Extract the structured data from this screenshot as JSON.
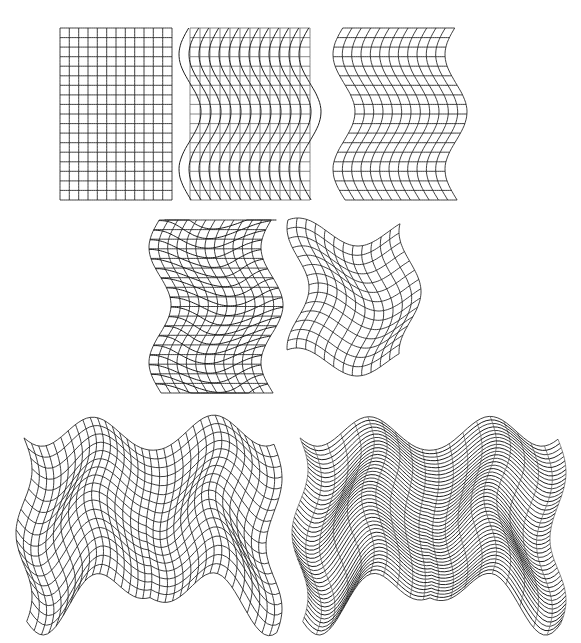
{
  "figure": {
    "width": 581,
    "height": 643,
    "background": "#ffffff",
    "line_color": "#2a2a2a",
    "panels": [
      {
        "id": "regular-grid",
        "description": "Undistorted rectangular grid",
        "x": 60,
        "y": 28,
        "w": 112,
        "h": 172,
        "cols": 12,
        "rows": 18,
        "warp": "none"
      },
      {
        "id": "grid-with-wavy-verticals",
        "description": "Regular grid overlaid with sinusoidally displaced vertical lines",
        "x": 190,
        "y": 28,
        "w": 120,
        "h": 172,
        "cols": 12,
        "rows": 18,
        "warp": "overlay-verticals",
        "amp": 11,
        "period": 115,
        "phase_y": 112
      },
      {
        "id": "horizontally-warped-grid",
        "description": "Whole grid displaced horizontally by a sine of y",
        "x": 344,
        "y": 28,
        "w": 112,
        "h": 172,
        "cols": 12,
        "rows": 18,
        "warp": "shift-x",
        "amp": 11,
        "period": 115,
        "phase_y": 112
      },
      {
        "id": "warped-grid-with-wavy-horizontals",
        "description": "Horizontally warped grid overlaid with sinusoidal horizontal lines",
        "x": 160,
        "y": 220,
        "w": 112,
        "h": 173,
        "cols": 12,
        "rows": 18,
        "warp": "shift-x-overlay-horizontals",
        "amp": 11,
        "period": 115,
        "phase_y": 305,
        "amp2": 9,
        "period2": 115,
        "phase_x": 190
      },
      {
        "id": "doubly-warped-grid",
        "description": "Grid displaced in both x and y",
        "x": 298,
        "y": 232,
        "w": 112,
        "h": 130,
        "cols": 12,
        "rows": 14,
        "warp": "shift-xy",
        "amp": 11,
        "period": 120,
        "phase_y": 300,
        "amp2": 14,
        "period2": 120,
        "phase_x": 338
      },
      {
        "id": "dense-warped-mesh",
        "description": "Strongly distorted dense mesh",
        "x": 24,
        "y": 450,
        "w": 250,
        "h": 130,
        "cols": 34,
        "rows": 18,
        "warp": "complex-mesh",
        "amp": 24,
        "period": 120,
        "amp2": 26,
        "period2": 118
      },
      {
        "id": "wavy-line-field",
        "description": "Strongly distorted mesh, horizontal lines emphasized",
        "x": 300,
        "y": 450,
        "w": 258,
        "h": 130,
        "cols": 12,
        "rows": 22,
        "warp": "complex-lines",
        "amp": 24,
        "period": 120,
        "amp2": 26,
        "period2": 118
      }
    ]
  }
}
